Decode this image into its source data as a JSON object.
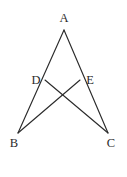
{
  "figure": {
    "background_color": "#ffffff",
    "stroke_color": "#2b2b2b",
    "label_color": "#2b2b2b",
    "width": 127,
    "height": 177,
    "points": [
      {
        "id": "A",
        "label": "A",
        "x": 64,
        "y": 30,
        "label_x": 64,
        "label_y": 22
      },
      {
        "id": "D",
        "label": "D",
        "x": 45,
        "y": 80,
        "label_x": 36,
        "label_y": 84
      },
      {
        "id": "E",
        "label": "E",
        "x": 80,
        "y": 80,
        "label_x": 90,
        "label_y": 84
      },
      {
        "id": "B",
        "label": "B",
        "x": 18,
        "y": 133,
        "label_x": 14,
        "label_y": 147
      },
      {
        "id": "C",
        "label": "C",
        "x": 108,
        "y": 133,
        "label_x": 111,
        "label_y": 147
      }
    ],
    "segments": [
      {
        "id": "AB",
        "from": "A",
        "to": "B",
        "x1": 64,
        "y1": 30,
        "x2": 18,
        "y2": 133
      },
      {
        "id": "AC",
        "from": "A",
        "to": "C",
        "x1": 64,
        "y1": 30,
        "x2": 108,
        "y2": 133
      },
      {
        "id": "DC",
        "from": "D",
        "to": "C",
        "x1": 45,
        "y1": 80,
        "x2": 108,
        "y2": 133
      },
      {
        "id": "EB",
        "from": "E",
        "to": "B",
        "x1": 80,
        "y1": 80,
        "x2": 18,
        "y2": 133
      }
    ],
    "labels": {
      "A": "A",
      "B": "B",
      "C": "C",
      "D": "D",
      "E": "E"
    }
  }
}
